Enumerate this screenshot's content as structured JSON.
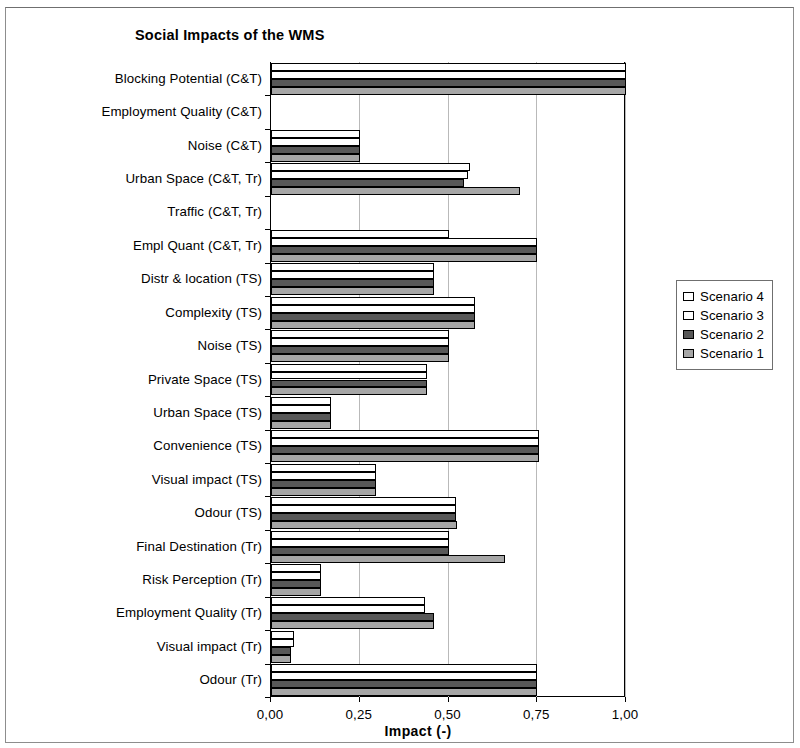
{
  "chart": {
    "title": "Social Impacts of the WMS",
    "xlabel": "Impact (-)"
  },
  "legend": {
    "items": [
      {
        "label": "Scenario 4",
        "color": "#ffffff"
      },
      {
        "label": "Scenario 3",
        "color": "#ffffff"
      },
      {
        "label": "Scenario 2",
        "color": "#585858"
      },
      {
        "label": "Scenario 1",
        "color": "#a6a6a6"
      }
    ]
  },
  "axis": {
    "tick_labels": [
      "0,00",
      "0,25",
      "0,50",
      "0,75",
      "1,00"
    ],
    "tick_values": [
      0,
      0.25,
      0.5,
      0.75,
      1.0
    ]
  },
  "chart_data": {
    "type": "bar",
    "orientation": "horizontal",
    "title": "Social Impacts of the WMS",
    "xlabel": "Impact (-)",
    "ylabel": "",
    "xlim": [
      0,
      1.0
    ],
    "xticks": [
      0,
      0.25,
      0.5,
      0.75,
      1.0
    ],
    "xtick_labels": [
      "0,00",
      "0,25",
      "0,50",
      "0,75",
      "1,00"
    ],
    "grid": "vertical",
    "legend_position": "right",
    "categories": [
      "Blocking Potential (C&T)",
      "Employment  Quality (C&T)",
      "Noise (C&T)",
      "Urban Space (C&T, Tr)",
      "Traffic (C&T, Tr)",
      "Empl Quant (C&T, Tr)",
      "Distr & location (TS)",
      "Complexity (TS)",
      "Noise (TS)",
      "Private Space (TS)",
      "Urban Space (TS)",
      "Convenience (TS)",
      "Visual impact (TS)",
      "Odour (TS)",
      "Final Destination (Tr)",
      "Risk Perception (Tr)",
      "Employment Quality (Tr)",
      "Visual impact (Tr)",
      "Odour (Tr)"
    ],
    "series": [
      {
        "name": "Scenario 4",
        "color": "#ffffff",
        "values": [
          1.0,
          0.0,
          0.25,
          0.56,
          0.0,
          0.5,
          0.46,
          0.575,
          0.5,
          0.44,
          0.17,
          0.755,
          0.295,
          0.52,
          0.5,
          0.14,
          0.435,
          0.065,
          0.75
        ]
      },
      {
        "name": "Scenario 3",
        "color": "#ffffff",
        "values": [
          1.0,
          0.0,
          0.25,
          0.555,
          0.0,
          0.75,
          0.46,
          0.575,
          0.5,
          0.44,
          0.17,
          0.755,
          0.295,
          0.52,
          0.5,
          0.14,
          0.435,
          0.065,
          0.75
        ]
      },
      {
        "name": "Scenario 2",
        "color": "#585858",
        "values": [
          1.0,
          0.0,
          0.25,
          0.545,
          0.0,
          0.75,
          0.46,
          0.575,
          0.5,
          0.44,
          0.17,
          0.755,
          0.295,
          0.52,
          0.5,
          0.14,
          0.46,
          0.055,
          0.75
        ]
      },
      {
        "name": "Scenario 1",
        "color": "#a6a6a6",
        "values": [
          1.0,
          0.0,
          0.25,
          0.7,
          0.0,
          0.75,
          0.46,
          0.575,
          0.5,
          0.44,
          0.17,
          0.755,
          0.295,
          0.525,
          0.66,
          0.14,
          0.46,
          0.055,
          0.75
        ]
      }
    ]
  }
}
